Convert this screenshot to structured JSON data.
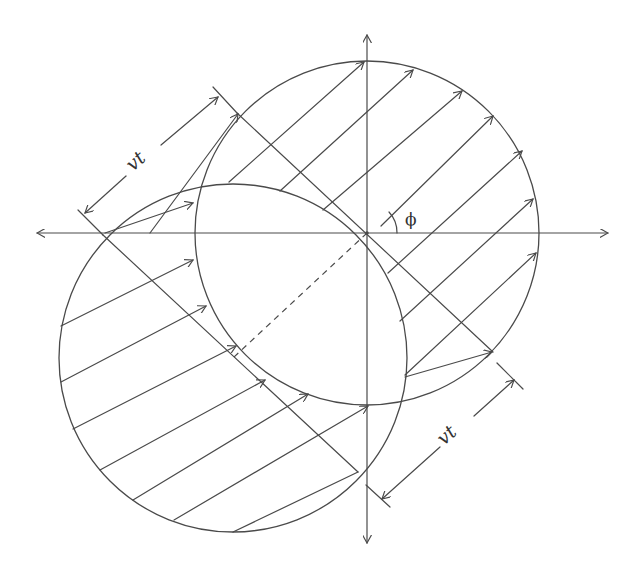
{
  "diagram": {
    "labels": {
      "upper_displacement": "vt",
      "lower_displacement": "vt",
      "angle": "ϕ"
    },
    "colors": {
      "stroke": "#4a4a4a",
      "background": "#ffffff",
      "text": "#333333"
    },
    "axes": {
      "origin": [
        367,
        233
      ],
      "horizontal": {
        "x1": 37,
        "x2": 608,
        "arrows": "both"
      },
      "vertical": {
        "y1": 35,
        "y2": 543,
        "arrows": "both"
      }
    },
    "circles": [
      {
        "name": "circle-displaced",
        "cx": 367,
        "cy": 233,
        "r": 172
      },
      {
        "name": "circle-original",
        "cx": 233,
        "cy": 358,
        "r": 174
      }
    ],
    "direction_angle_deg": 43
  }
}
